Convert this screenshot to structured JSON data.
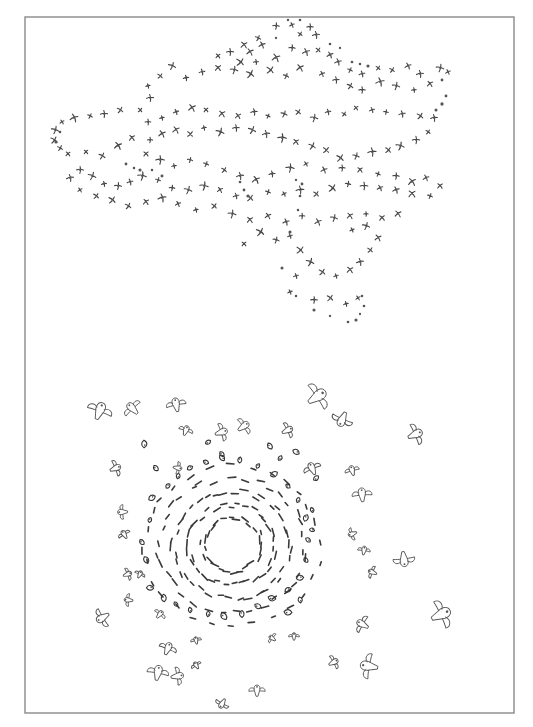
{
  "figure": {
    "width": 533,
    "height": 727,
    "background": "#ffffff",
    "frame": {
      "x": 25,
      "y": 17,
      "width": 489,
      "height": 696,
      "stroke": "#8a8a8a"
    },
    "text": []
  },
  "upper_flock": {
    "description": "irregular scattered cloud of small cross-shaped bird glyphs and dots",
    "crosses": [
      [
        276,
        26
      ],
      [
        292,
        25
      ],
      [
        310,
        27
      ],
      [
        300,
        34
      ],
      [
        316,
        35
      ],
      [
        258,
        38
      ],
      [
        244,
        45
      ],
      [
        262,
        45
      ],
      [
        250,
        52
      ],
      [
        230,
        52
      ],
      [
        218,
        56
      ],
      [
        240,
        62
      ],
      [
        256,
        62
      ],
      [
        276,
        58
      ],
      [
        292,
        48
      ],
      [
        306,
        52
      ],
      [
        318,
        50
      ],
      [
        330,
        55
      ],
      [
        338,
        62
      ],
      [
        350,
        70
      ],
      [
        362,
        74
      ],
      [
        378,
        68
      ],
      [
        392,
        70
      ],
      [
        408,
        66
      ],
      [
        420,
        74
      ],
      [
        440,
        68
      ],
      [
        448,
        72
      ],
      [
        430,
        84
      ],
      [
        414,
        90
      ],
      [
        396,
        86
      ],
      [
        380,
        82
      ],
      [
        362,
        90
      ],
      [
        350,
        86
      ],
      [
        336,
        80
      ],
      [
        322,
        74
      ],
      [
        300,
        68
      ],
      [
        286,
        76
      ],
      [
        270,
        70
      ],
      [
        250,
        74
      ],
      [
        234,
        70
      ],
      [
        218,
        68
      ],
      [
        202,
        72
      ],
      [
        186,
        78
      ],
      [
        172,
        66
      ],
      [
        160,
        76
      ],
      [
        148,
        86
      ],
      [
        150,
        98
      ],
      [
        140,
        110
      ],
      [
        120,
        110
      ],
      [
        104,
        114
      ],
      [
        90,
        116
      ],
      [
        74,
        118
      ],
      [
        62,
        122
      ],
      [
        55,
        130
      ],
      [
        54,
        140
      ],
      [
        60,
        148
      ],
      [
        68,
        154
      ],
      [
        86,
        152
      ],
      [
        102,
        156
      ],
      [
        118,
        146
      ],
      [
        132,
        138
      ],
      [
        148,
        122
      ],
      [
        162,
        118
      ],
      [
        176,
        112
      ],
      [
        192,
        108
      ],
      [
        206,
        110
      ],
      [
        222,
        114
      ],
      [
        238,
        116
      ],
      [
        254,
        112
      ],
      [
        268,
        116
      ],
      [
        284,
        114
      ],
      [
        298,
        112
      ],
      [
        314,
        118
      ],
      [
        328,
        112
      ],
      [
        344,
        114
      ],
      [
        356,
        108
      ],
      [
        372,
        110
      ],
      [
        386,
        112
      ],
      [
        402,
        114
      ],
      [
        420,
        116
      ],
      [
        434,
        118
      ],
      [
        428,
        132
      ],
      [
        416,
        140
      ],
      [
        400,
        146
      ],
      [
        388,
        150
      ],
      [
        372,
        152
      ],
      [
        356,
        156
      ],
      [
        340,
        158
      ],
      [
        326,
        150
      ],
      [
        312,
        146
      ],
      [
        296,
        142
      ],
      [
        282,
        138
      ],
      [
        266,
        134
      ],
      [
        252,
        130
      ],
      [
        236,
        128
      ],
      [
        220,
        132
      ],
      [
        204,
        128
      ],
      [
        190,
        134
      ],
      [
        176,
        130
      ],
      [
        162,
        134
      ],
      [
        150,
        140
      ],
      [
        146,
        154
      ],
      [
        160,
        160
      ],
      [
        174,
        166
      ],
      [
        190,
        160
      ],
      [
        206,
        164
      ],
      [
        224,
        170
      ],
      [
        240,
        176
      ],
      [
        256,
        180
      ],
      [
        272,
        174
      ],
      [
        290,
        168
      ],
      [
        306,
        164
      ],
      [
        324,
        170
      ],
      [
        342,
        168
      ],
      [
        360,
        170
      ],
      [
        378,
        174
      ],
      [
        396,
        176
      ],
      [
        412,
        182
      ],
      [
        426,
        178
      ],
      [
        440,
        186
      ],
      [
        430,
        196
      ],
      [
        412,
        194
      ],
      [
        396,
        190
      ],
      [
        380,
        188
      ],
      [
        364,
        186
      ],
      [
        348,
        184
      ],
      [
        332,
        188
      ],
      [
        316,
        194
      ],
      [
        300,
        190
      ],
      [
        284,
        194
      ],
      [
        268,
        192
      ],
      [
        250,
        198
      ],
      [
        236,
        196
      ],
      [
        220,
        190
      ],
      [
        204,
        186
      ],
      [
        188,
        190
      ],
      [
        172,
        188
      ],
      [
        158,
        180
      ],
      [
        142,
        176
      ],
      [
        130,
        182
      ],
      [
        118,
        186
      ],
      [
        104,
        184
      ],
      [
        92,
        176
      ],
      [
        80,
        170
      ],
      [
        70,
        178
      ],
      [
        80,
        190
      ],
      [
        96,
        196
      ],
      [
        112,
        200
      ],
      [
        128,
        206
      ],
      [
        146,
        202
      ],
      [
        162,
        198
      ],
      [
        178,
        204
      ],
      [
        196,
        210
      ],
      [
        214,
        206
      ],
      [
        232,
        214
      ],
      [
        250,
        220
      ],
      [
        268,
        216
      ],
      [
        286,
        222
      ],
      [
        302,
        216
      ],
      [
        318,
        222
      ],
      [
        334,
        218
      ],
      [
        350,
        216
      ],
      [
        366,
        214
      ],
      [
        382,
        218
      ],
      [
        398,
        214
      ],
      [
        290,
        236
      ],
      [
        276,
        240
      ],
      [
        260,
        232
      ],
      [
        244,
        244
      ],
      [
        300,
        250
      ],
      [
        310,
        262
      ],
      [
        322,
        272
      ],
      [
        336,
        276
      ],
      [
        350,
        270
      ],
      [
        360,
        262
      ],
      [
        370,
        250
      ],
      [
        378,
        238
      ],
      [
        366,
        226
      ],
      [
        352,
        230
      ],
      [
        296,
        276
      ],
      [
        290,
        292
      ],
      [
        314,
        300
      ],
      [
        330,
        298
      ],
      [
        346,
        304
      ],
      [
        358,
        298
      ]
    ],
    "dots": [
      [
        288,
        20
      ],
      [
        300,
        20
      ],
      [
        276,
        38
      ],
      [
        330,
        44
      ],
      [
        340,
        48
      ],
      [
        352,
        62
      ],
      [
        360,
        64
      ],
      [
        368,
        66
      ],
      [
        442,
        80
      ],
      [
        446,
        96
      ],
      [
        442,
        104
      ],
      [
        436,
        110
      ],
      [
        60,
        132
      ],
      [
        56,
        142
      ],
      [
        126,
        164
      ],
      [
        134,
        168
      ],
      [
        140,
        170
      ],
      [
        152,
        170
      ],
      [
        162,
        176
      ],
      [
        240,
        182
      ],
      [
        244,
        190
      ],
      [
        248,
        196
      ],
      [
        296,
        180
      ],
      [
        302,
        184
      ],
      [
        300,
        196
      ],
      [
        298,
        210
      ],
      [
        290,
        232
      ],
      [
        282,
        268
      ],
      [
        296,
        296
      ],
      [
        314,
        310
      ],
      [
        330,
        316
      ],
      [
        348,
        322
      ],
      [
        356,
        320
      ],
      [
        360,
        314
      ],
      [
        364,
        306
      ],
      [
        362,
        296
      ]
    ]
  },
  "lower_flock": {
    "description": "vortex ring of dash-shaped birds around a hollow center, surrounded by larger outlined birds",
    "vortex_center": [
      232,
      545
    ],
    "vortex_rings": [
      {
        "radius": 28,
        "count": 26
      },
      {
        "radius": 42,
        "count": 34
      },
      {
        "radius": 56,
        "count": 38
      },
      {
        "radius": 70,
        "count": 34
      },
      {
        "radius": 84,
        "count": 28
      }
    ],
    "outlined_birds": [
      {
        "x": 100,
        "y": 410,
        "size": 14
      },
      {
        "x": 132,
        "y": 408,
        "size": 11
      },
      {
        "x": 176,
        "y": 404,
        "size": 11
      },
      {
        "x": 318,
        "y": 396,
        "size": 16
      },
      {
        "x": 342,
        "y": 420,
        "size": 12
      },
      {
        "x": 416,
        "y": 434,
        "size": 12
      },
      {
        "x": 186,
        "y": 430,
        "size": 8
      },
      {
        "x": 222,
        "y": 432,
        "size": 10
      },
      {
        "x": 244,
        "y": 426,
        "size": 10
      },
      {
        "x": 288,
        "y": 430,
        "size": 9
      },
      {
        "x": 116,
        "y": 468,
        "size": 9
      },
      {
        "x": 178,
        "y": 468,
        "size": 7
      },
      {
        "x": 312,
        "y": 468,
        "size": 10
      },
      {
        "x": 352,
        "y": 470,
        "size": 8
      },
      {
        "x": 362,
        "y": 494,
        "size": 11
      },
      {
        "x": 122,
        "y": 512,
        "size": 8
      },
      {
        "x": 124,
        "y": 534,
        "size": 7
      },
      {
        "x": 352,
        "y": 534,
        "size": 7
      },
      {
        "x": 364,
        "y": 550,
        "size": 7
      },
      {
        "x": 404,
        "y": 560,
        "size": 12
      },
      {
        "x": 372,
        "y": 572,
        "size": 7
      },
      {
        "x": 128,
        "y": 574,
        "size": 7
      },
      {
        "x": 140,
        "y": 574,
        "size": 6
      },
      {
        "x": 128,
        "y": 600,
        "size": 7
      },
      {
        "x": 102,
        "y": 618,
        "size": 11
      },
      {
        "x": 160,
        "y": 614,
        "size": 7
      },
      {
        "x": 196,
        "y": 640,
        "size": 6
      },
      {
        "x": 272,
        "y": 638,
        "size": 6
      },
      {
        "x": 294,
        "y": 636,
        "size": 6
      },
      {
        "x": 362,
        "y": 624,
        "size": 10
      },
      {
        "x": 442,
        "y": 614,
        "size": 16
      },
      {
        "x": 334,
        "y": 662,
        "size": 8
      },
      {
        "x": 368,
        "y": 666,
        "size": 14
      },
      {
        "x": 168,
        "y": 648,
        "size": 10
      },
      {
        "x": 158,
        "y": 672,
        "size": 12
      },
      {
        "x": 178,
        "y": 676,
        "size": 10
      },
      {
        "x": 196,
        "y": 665,
        "size": 6
      },
      {
        "x": 257,
        "y": 690,
        "size": 9
      },
      {
        "x": 222,
        "y": 704,
        "size": 8
      }
    ],
    "small_glyphs": [
      [
        144,
        444
      ],
      [
        156,
        468
      ],
      [
        152,
        498
      ],
      [
        150,
        520
      ],
      [
        142,
        542
      ],
      [
        146,
        560
      ],
      [
        150,
        588
      ],
      [
        164,
        598
      ],
      [
        176,
        604
      ],
      [
        190,
        610
      ],
      [
        208,
        614
      ],
      [
        224,
        616
      ],
      [
        242,
        614
      ],
      [
        258,
        606
      ],
      [
        272,
        598
      ],
      [
        288,
        590
      ],
      [
        300,
        578
      ],
      [
        306,
        560
      ],
      [
        308,
        540
      ],
      [
        306,
        518
      ],
      [
        298,
        500
      ],
      [
        288,
        486
      ],
      [
        274,
        474
      ],
      [
        258,
        466
      ],
      [
        240,
        460
      ],
      [
        222,
        458
      ],
      [
        206,
        462
      ],
      [
        190,
        468
      ],
      [
        178,
        476
      ],
      [
        168,
        486
      ],
      [
        316,
        478
      ],
      [
        312,
        510
      ],
      [
        312,
        530
      ],
      [
        288,
        612
      ],
      [
        300,
        600
      ],
      [
        208,
        442
      ],
      [
        222,
        454
      ],
      [
        270,
        446
      ],
      [
        280,
        458
      ],
      [
        296,
        452
      ]
    ]
  }
}
